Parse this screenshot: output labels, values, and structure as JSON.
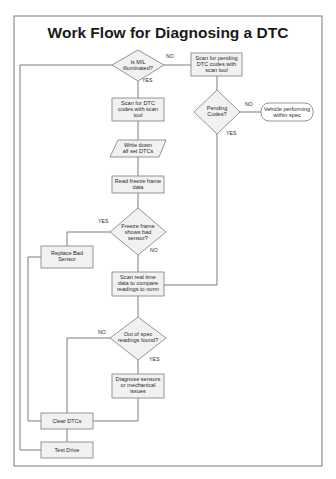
{
  "title": "Work Flow for Diagnosing a DTC",
  "colors": {
    "box_fill": "#f1f1f1",
    "box_stroke": "#8a8a8a",
    "line": "#6e6e6e",
    "frame": "#7a7a7a"
  },
  "nodes": {
    "mil": {
      "type": "decision",
      "lines": [
        "Is MIL",
        "illuminated?"
      ]
    },
    "scan_pending": {
      "type": "process",
      "lines": [
        "Scan for pending",
        "DTC codes with",
        "scan tool"
      ]
    },
    "scan_dtc": {
      "type": "process",
      "lines": [
        "Scan for DTC",
        "codes with scan",
        "tool"
      ]
    },
    "pending_codes": {
      "type": "decision",
      "lines": [
        "Pending",
        "Codes?"
      ]
    },
    "vehicle_ok": {
      "type": "terminator",
      "lines": [
        "Vehicle performing",
        "within spec"
      ]
    },
    "write_down": {
      "type": "io",
      "lines": [
        "Write down",
        "all set DTCs"
      ]
    },
    "read_freeze": {
      "type": "process",
      "lines": [
        "Read freeze frame",
        "data"
      ]
    },
    "freeze_bad": {
      "type": "decision",
      "lines": [
        "Freeze frame",
        "shows bad",
        "sensor?"
      ]
    },
    "replace_sensor": {
      "type": "process",
      "lines": [
        "Replace Bad",
        "Sensor"
      ]
    },
    "scan_realtime": {
      "type": "process",
      "lines": [
        "Scan real time",
        "data to compare",
        "readings to norm"
      ]
    },
    "out_of_spec": {
      "type": "decision",
      "lines": [
        "Out of spec",
        "readings found?"
      ]
    },
    "diagnose": {
      "type": "process",
      "lines": [
        "Diagnose sensors",
        "or mechanical",
        "issues"
      ]
    },
    "clear_dtcs": {
      "type": "process",
      "lines": [
        "Clear DTCs"
      ]
    },
    "test_drive": {
      "type": "process",
      "lines": [
        "Test Drive"
      ]
    }
  },
  "edge_labels": {
    "mil_no": "NO",
    "mil_yes": "YES",
    "pending_no": "NO",
    "pending_yes": "YES",
    "freeze_yes": "YES",
    "freeze_no": "NO",
    "spec_no": "NO",
    "spec_yes": "YES"
  }
}
